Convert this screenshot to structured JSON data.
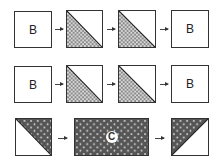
{
  "rows": [
    {
      "boxes": [
        {
          "type": "plain",
          "label": "B"
        },
        {
          "type": "half-hatched-lower-left"
        },
        {
          "type": "half-hatched-lower-left"
        },
        {
          "type": "plain",
          "label": "B"
        }
      ]
    },
    {
      "boxes": [
        {
          "type": "plain",
          "label": "B"
        },
        {
          "type": "half-hatched-lower-left"
        },
        {
          "type": "half-hatched-lower-left"
        },
        {
          "type": "plain",
          "label": "B"
        }
      ]
    },
    {
      "boxes": [
        {
          "type": "half-dotted-upper-right"
        },
        {
          "type": "dotted-rectangle",
          "label": "C"
        },
        {
          "type": "half-dotted-upper-left"
        }
      ]
    }
  ],
  "colors": {
    "outline": "#333333",
    "hatch": "#9a9a9a",
    "dark_fill": "#555555",
    "dots": "#e0e0e0"
  }
}
